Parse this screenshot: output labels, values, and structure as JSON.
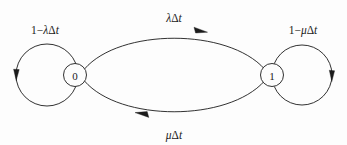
{
  "diagram": {
    "type": "markov-chain-state-transition",
    "title": "",
    "background_color": "#fdfdfd",
    "stroke_color": "#1b1b1b",
    "nodes": [
      {
        "id": "state-0",
        "label": "0",
        "cx": 75,
        "cy": 75,
        "r": 11
      },
      {
        "id": "state-1",
        "label": "1",
        "cx": 272,
        "cy": 75,
        "r": 11
      }
    ],
    "edges": [
      {
        "id": "self-loop-0",
        "from": "0",
        "to": "0",
        "label": "1−λΔt",
        "label_x": 45,
        "label_y": 34,
        "kind": "self-loop-left"
      },
      {
        "id": "zero-to-one",
        "from": "0",
        "to": "1",
        "label": "λΔt",
        "label_x": 174,
        "label_y": 22,
        "kind": "arc-top"
      },
      {
        "id": "one-to-zero",
        "from": "1",
        "to": "0",
        "label": "μΔt",
        "label_x": 174,
        "label_y": 138,
        "kind": "arc-bottom"
      },
      {
        "id": "self-loop-1",
        "from": "1",
        "to": "1",
        "label": "1−μΔt",
        "label_x": 303,
        "label_y": 34,
        "kind": "self-loop-right"
      }
    ],
    "label_parts": {
      "self_loop_0": {
        "one": "1",
        "minus": "−",
        "rate": "λ",
        "delta": "Δ",
        "time": "t"
      },
      "top_arc": {
        "rate": "λ",
        "delta": "Δ",
        "time": "t"
      },
      "bottom_arc": {
        "rate": "μ",
        "delta": "Δ",
        "time": "t"
      },
      "self_loop_1": {
        "one": "1",
        "minus": "−",
        "rate": "μ",
        "delta": "Δ",
        "time": "t"
      }
    }
  }
}
